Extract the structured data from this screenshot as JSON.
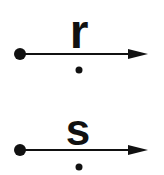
{
  "diagram": {
    "rows": [
      {
        "label": "r",
        "color": "#111111",
        "elements": [
          "start-dot",
          "arrow-line",
          "arrowhead",
          "label",
          "below-dot"
        ]
      },
      {
        "label": "s",
        "color": "#111111",
        "elements": [
          "start-dot",
          "arrow-line",
          "arrowhead",
          "label",
          "below-dot"
        ]
      }
    ],
    "background": "#ffffff"
  }
}
